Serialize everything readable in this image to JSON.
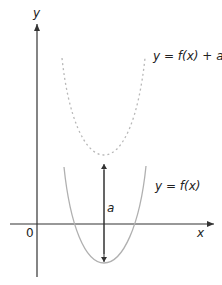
{
  "diagram": {
    "axes": {
      "x_label": "x",
      "y_label": "y",
      "origin_label": "0"
    },
    "curves": [
      {
        "name": "original",
        "label": "y = f(x)",
        "style": "solid",
        "color": "#b0b0b0"
      },
      {
        "name": "translated",
        "label": "y = f(x) + a",
        "style": "dashed",
        "color": "#b8b8b8"
      }
    ],
    "translation": {
      "label": "a",
      "direction": "up"
    },
    "colors": {
      "axis": "#333333",
      "arrow": "#333333",
      "text": "#222222"
    }
  }
}
